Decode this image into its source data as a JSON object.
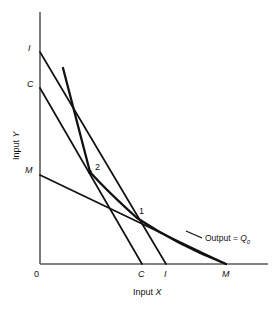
{
  "figure": {
    "type": "economics-isoquant-isocost-diagram",
    "background": "#ffffff",
    "line_color": "#111111",
    "axis_color": "#5a5a5a"
  },
  "axes": {
    "x_title": "Input X",
    "y_title": "Input Y",
    "origin_label": "0"
  },
  "y_axis_labels": {
    "i": "I",
    "c": "C",
    "m": "M"
  },
  "x_axis_labels": {
    "c": "C",
    "i": "I",
    "m": "M"
  },
  "points": {
    "one": "1",
    "two": "2"
  },
  "annotations": {
    "output_text": "Output  =  ",
    "output_symbol": "Q",
    "output_subscript": "0"
  },
  "chart_data": {
    "type": "line",
    "title": "",
    "xlabel": "Input X",
    "ylabel": "Input Y",
    "pixel_geometry": {
      "origin": [
        40,
        264
      ],
      "y_axis_top": [
        40,
        12
      ],
      "x_axis_right": [
        268,
        264
      ]
    },
    "series": [
      {
        "name": "isocost-I",
        "kind": "straight",
        "points": [
          [
            40,
            52
          ],
          [
            166,
            264
          ]
        ]
      },
      {
        "name": "isocost-C",
        "kind": "straight",
        "points": [
          [
            40,
            88
          ],
          [
            142,
            264
          ]
        ]
      },
      {
        "name": "isocost-M",
        "kind": "straight",
        "points": [
          [
            40,
            175
          ],
          [
            226,
            264
          ]
        ]
      },
      {
        "name": "isoquant-Q0",
        "kind": "kinked-curve",
        "points": [
          [
            63,
            68
          ],
          [
            90,
            172
          ],
          [
            112,
            196
          ],
          [
            137,
            218
          ],
          [
            180,
            243
          ],
          [
            226,
            264
          ]
        ]
      }
    ]
  }
}
